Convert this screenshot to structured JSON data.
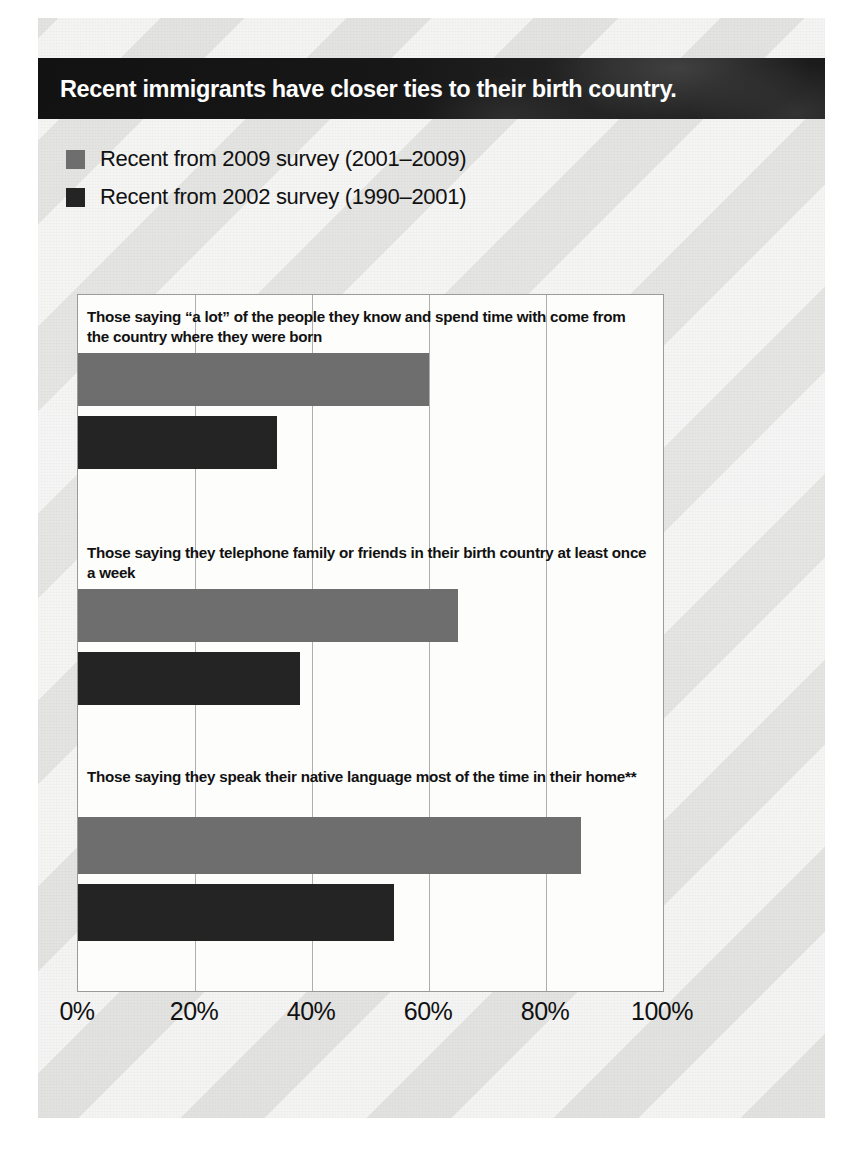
{
  "banner": {
    "title": "Recent immigrants have closer ties to their birth country."
  },
  "legend": {
    "items": [
      {
        "label": "Recent from 2009 survey (2001–2009)",
        "color": "#6e6e6e",
        "key": "recent2009"
      },
      {
        "label": "Recent from 2002 survey (1990–2001)",
        "color": "#242424",
        "key": "recent2002"
      }
    ]
  },
  "axis": {
    "tick_labels": [
      "0%",
      "20%",
      "40%",
      "60%",
      "80%",
      "100%"
    ],
    "tick_values": [
      0,
      20,
      40,
      60,
      80,
      100
    ]
  },
  "chart_data": {
    "type": "bar",
    "orientation": "horizontal",
    "title": "Recent immigrants have closer ties to their birth country.",
    "xlabel": "",
    "ylabel": "",
    "xlim": [
      0,
      100
    ],
    "grid": true,
    "legend_position": "top-left",
    "categories": [
      "Those saying “a lot” of the people they know and spend time with come from the country where they were born",
      "Those saying they telephone family or friends in their birth country at least once a week",
      "Those saying they speak their native language most of the time in their home**"
    ],
    "series": [
      {
        "name": "Recent from 2009 survey (2001–2009)",
        "color": "#6e6e6e",
        "values": [
          60,
          65,
          86
        ]
      },
      {
        "name": "Recent from 2002 survey (1990–2001)",
        "color": "#242424",
        "values": [
          34,
          38,
          54
        ]
      }
    ]
  }
}
